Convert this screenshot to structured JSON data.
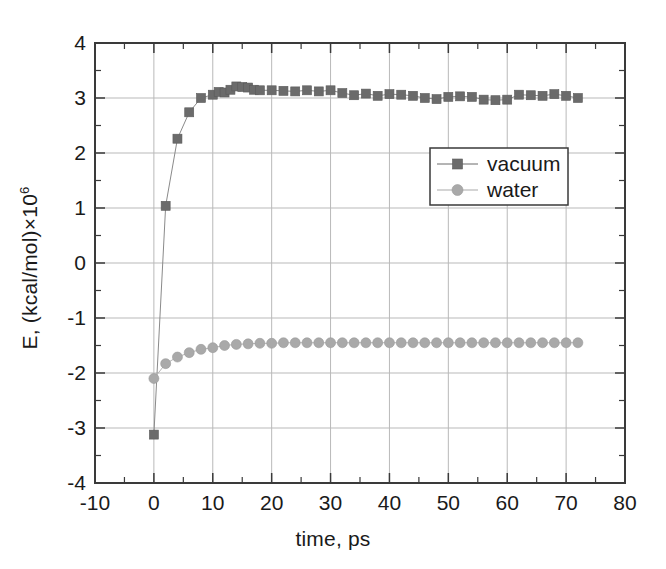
{
  "chart_data": {
    "type": "scatter",
    "title": "",
    "subtitle": "",
    "xlabel": "time, ps",
    "ylabel": "E, (kcal/mol)×10⁶",
    "ylabel_base": "E, (kcal/mol)×10",
    "ylabel_exponent": "6",
    "xlim": [
      -10,
      80
    ],
    "ylim": [
      -4,
      4
    ],
    "xticks": [
      -10,
      0,
      10,
      20,
      30,
      40,
      50,
      60,
      70,
      80
    ],
    "xticklabels": [
      "-10",
      "0",
      "10",
      "20",
      "30",
      "40",
      "50",
      "60",
      "70",
      "80"
    ],
    "yticks": [
      -4,
      -3,
      -2,
      -1,
      0,
      1,
      2,
      3,
      4
    ],
    "yticklabels": [
      "-4",
      "-3",
      "-2",
      "-1",
      "0",
      "1",
      "2",
      "3",
      "4"
    ],
    "x_minor_tick_interval": 5,
    "y_minor_tick_interval": 0.5,
    "grid": true,
    "grid_color": "#b9b9b9",
    "axis_color": "#3a3a3a",
    "background": "#ffffff",
    "legend_position": "center-right",
    "legend": {
      "box": {
        "x": 430,
        "y": 148,
        "width": 138,
        "height": 57
      },
      "entries": [
        {
          "label": "vacuum",
          "marker": "square",
          "color": "#6b6b6b"
        },
        {
          "label": "water",
          "marker": "circle",
          "color": "#a9a9a9"
        }
      ]
    },
    "series": [
      {
        "name": "vacuum",
        "marker": "square",
        "color": "#6b6b6b",
        "line_color": "#8a8a8a",
        "marker_size": 9,
        "x": [
          0,
          2,
          4,
          6,
          8,
          10,
          11,
          12,
          13,
          14,
          15,
          16,
          17,
          18,
          20,
          22,
          24,
          26,
          28,
          30,
          32,
          34,
          36,
          38,
          40,
          42,
          44,
          46,
          48,
          50,
          52,
          54,
          56,
          58,
          60,
          62,
          64,
          66,
          68,
          70,
          72
        ],
        "y": [
          -3.12,
          1.04,
          2.26,
          2.74,
          3.0,
          3.06,
          3.11,
          3.1,
          3.15,
          3.21,
          3.2,
          3.19,
          3.15,
          3.14,
          3.14,
          3.13,
          3.12,
          3.14,
          3.12,
          3.14,
          3.09,
          3.05,
          3.08,
          3.04,
          3.07,
          3.06,
          3.04,
          3.0,
          2.98,
          3.02,
          3.03,
          3.02,
          2.97,
          2.96,
          2.97,
          3.06,
          3.05,
          3.04,
          3.07,
          3.04,
          3.0
        ]
      },
      {
        "name": "water",
        "marker": "circle",
        "color": "#a9a9a9",
        "line_color": "#b5b5b5",
        "marker_size": 10,
        "x": [
          0,
          2,
          4,
          6,
          8,
          10,
          12,
          14,
          16,
          18,
          20,
          22,
          24,
          26,
          28,
          30,
          32,
          34,
          36,
          38,
          40,
          42,
          44,
          46,
          48,
          50,
          52,
          54,
          56,
          58,
          60,
          62,
          64,
          66,
          68,
          70,
          72
        ],
        "y": [
          -2.1,
          -1.83,
          -1.71,
          -1.63,
          -1.57,
          -1.54,
          -1.5,
          -1.48,
          -1.47,
          -1.46,
          -1.46,
          -1.45,
          -1.45,
          -1.45,
          -1.45,
          -1.45,
          -1.45,
          -1.45,
          -1.45,
          -1.45,
          -1.45,
          -1.45,
          -1.45,
          -1.45,
          -1.45,
          -1.45,
          -1.45,
          -1.45,
          -1.45,
          -1.45,
          -1.45,
          -1.45,
          -1.45,
          -1.45,
          -1.45,
          -1.45,
          -1.45
        ]
      }
    ],
    "plot_area": {
      "left": 95,
      "top": 43,
      "right": 625,
      "bottom": 483
    }
  }
}
